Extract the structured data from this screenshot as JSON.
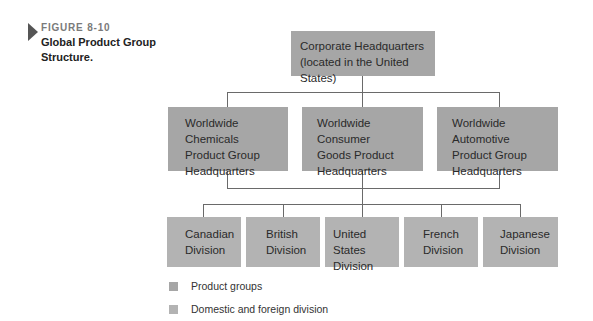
{
  "figure": {
    "label": "FIGURE 8-10",
    "title_line1": "Global Product Group",
    "title_line2": "Structure."
  },
  "colors": {
    "product_group": "#a6a6a6",
    "division": "#b3b3b3",
    "connector": "#6a6a6a"
  },
  "root": {
    "line1": "Corporate Headquarters",
    "line2": "(located in the United States)"
  },
  "product_groups": [
    {
      "line1": "Worldwide Chemicals",
      "line2": "Product Group",
      "line3": "Headquarters"
    },
    {
      "line1": "Worldwide Consumer",
      "line2": "Goods Product",
      "line3": "Headquarters"
    },
    {
      "line1": "Worldwide Automotive",
      "line2": "Product Group",
      "line3": "Headquarters"
    }
  ],
  "divisions": [
    {
      "line1": "Canadian",
      "line2": "Division"
    },
    {
      "line1": "British",
      "line2": "Division"
    },
    {
      "line1": "United States",
      "line2": "Division"
    },
    {
      "line1": "French",
      "line2": "Division"
    },
    {
      "line1": "Japanese",
      "line2": "Division"
    }
  ],
  "legend": [
    {
      "label": "Product groups",
      "swatch": "product_group"
    },
    {
      "label": "Domestic and foreign division",
      "swatch": "division"
    }
  ]
}
